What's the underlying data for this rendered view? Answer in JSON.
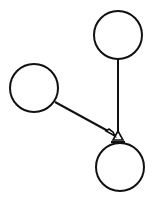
{
  "diagram": {
    "type": "graph",
    "stroke_color": "#111111",
    "background": "#ffffff",
    "nodes": [
      {
        "id": "top",
        "label": ""
      },
      {
        "id": "left",
        "label": ""
      },
      {
        "id": "bottom",
        "label": ""
      }
    ],
    "edges": [
      {
        "from": "top",
        "to": "bottom",
        "arrowhead": "hollow-triangle"
      },
      {
        "from": "left",
        "to": "bottom",
        "arrowhead": "hollow-triangle"
      }
    ]
  }
}
